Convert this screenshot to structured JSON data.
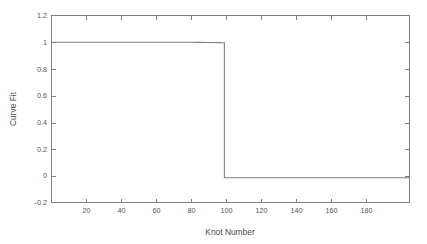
{
  "chart_data": {
    "type": "line",
    "title": "",
    "xlabel": "Knot Number",
    "ylabel": "Curve Fit",
    "xlim": [
      0,
      205
    ],
    "ylim": [
      -0.2,
      1.2
    ],
    "grid": false,
    "legend": null,
    "xticks": [
      20,
      40,
      60,
      80,
      100,
      120,
      140,
      160,
      180
    ],
    "xticklabels": [
      "20",
      "40",
      "60",
      "80",
      "100",
      "120",
      "140",
      "160",
      "180"
    ],
    "yticks": [
      -0.2,
      0,
      0.2,
      0.4,
      0.6,
      0.8,
      1,
      1.2
    ],
    "yticklabels": [
      "-0.2",
      "0",
      "0.2",
      "0.4",
      "0.6",
      "0.8",
      "1",
      "1.2"
    ],
    "line_color": "#808080",
    "axes_color": "#808080",
    "series": [
      {
        "name": "Curve Fit",
        "x": [
          1,
          10,
          20,
          30,
          40,
          50,
          60,
          70,
          80,
          85,
          90,
          93,
          95,
          96,
          97,
          98,
          98.5,
          99,
          99,
          100,
          101,
          105,
          110,
          120,
          130,
          140,
          150,
          160,
          170,
          180,
          190,
          200,
          205
        ],
        "y": [
          1.0,
          1.0,
          1.0,
          1.0,
          1.0,
          1.0,
          1.0,
          1.0,
          1.0,
          0.999,
          0.998,
          0.998,
          0.997,
          0.997,
          0.997,
          0.996,
          0.996,
          0.996,
          -0.015,
          -0.015,
          -0.015,
          -0.015,
          -0.015,
          -0.015,
          -0.015,
          -0.015,
          -0.015,
          -0.015,
          -0.015,
          -0.015,
          -0.015,
          -0.015,
          -0.015
        ]
      }
    ]
  },
  "axes": {
    "x_axis_title": "Knot Number",
    "y_axis_title": "Curve Fit"
  }
}
